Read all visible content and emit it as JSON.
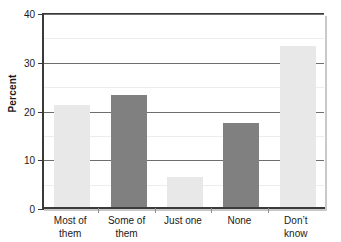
{
  "chart_data": {
    "type": "bar",
    "title": "",
    "xlabel": "",
    "ylabel": "Percent",
    "categories": [
      "Most of them",
      "Some of them",
      "Just one",
      "None",
      "Don't know"
    ],
    "category_lines": [
      [
        "Most of",
        "them"
      ],
      [
        "Some of",
        "them"
      ],
      [
        "Just one",
        ""
      ],
      [
        "None",
        ""
      ],
      [
        "Don’t",
        "know"
      ]
    ],
    "values": [
      21.1,
      23.2,
      6.4,
      17.4,
      33.2
    ],
    "ylim": [
      0,
      40
    ],
    "yticks": [
      0,
      10,
      20,
      30,
      40
    ],
    "ytick_labels": [
      "0",
      "10",
      "20",
      "30",
      "40"
    ],
    "minor_gridlines": [
      5,
      15,
      25,
      35
    ],
    "grid": true,
    "legend": "none",
    "bar_colors": [
      "#e8e8e8",
      "#808080",
      "#e8e8e8",
      "#808080",
      "#e8e8e8"
    ],
    "colors": {
      "axis": "#3a3a3a",
      "major_grid": "#6e6e6e",
      "minor_grid": "#ededed",
      "light_bar": "#e8e8e8",
      "dark_bar": "#808080",
      "text": "#1a1a1a",
      "background": "#ffffff"
    }
  }
}
